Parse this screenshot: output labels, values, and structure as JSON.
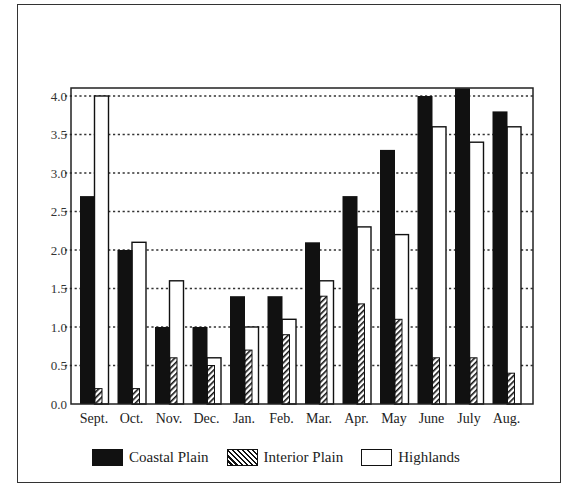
{
  "chart_data": {
    "type": "bar",
    "title": "",
    "xlabel": "",
    "ylabel": "",
    "ylim": [
      0,
      4.1
    ],
    "yticks": [
      "0.0",
      "0.5",
      "1.0",
      "1.5",
      "2.0",
      "2.5",
      "3.0",
      "3.5",
      "4.0"
    ],
    "grid": "horizontal dotted",
    "legend_position": "bottom",
    "categories": [
      "Sept.",
      "Oct.",
      "Nov.",
      "Dec.",
      "Jan.",
      "Feb.",
      "Mar.",
      "Apr.",
      "May",
      "June",
      "July",
      "Aug."
    ],
    "series": [
      {
        "name": "Coastal Plain",
        "fill": "solid-black",
        "values": [
          2.7,
          2.0,
          1.0,
          1.0,
          1.4,
          1.4,
          2.1,
          2.7,
          3.3,
          4.0,
          4.1,
          3.8
        ]
      },
      {
        "name": "Interior Plain",
        "fill": "diagonal-hatch",
        "values": [
          0.2,
          0.2,
          0.6,
          0.5,
          0.7,
          0.9,
          1.4,
          1.3,
          1.1,
          0.6,
          0.6,
          0.4
        ]
      },
      {
        "name": "Highlands",
        "fill": "white-outline",
        "values": [
          4.0,
          2.1,
          1.6,
          0.6,
          1.0,
          1.1,
          1.6,
          2.3,
          2.2,
          3.6,
          3.4,
          3.6
        ]
      }
    ]
  },
  "legend": {
    "coastal": "Coastal Plain",
    "interior": "Interior Plain",
    "highlands": "Highlands"
  },
  "colors": {
    "coastal": "#111111",
    "hatch": "#111111",
    "highlands": "#ffffff",
    "axis": "#222222"
  }
}
